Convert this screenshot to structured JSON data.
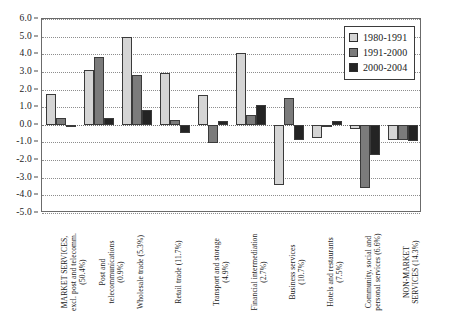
{
  "chart_data": {
    "type": "bar",
    "title": "",
    "subtitle": "",
    "xlabel": "",
    "ylabel": "",
    "ylim": [
      -5.0,
      6.0
    ],
    "ytick_step": 1.0,
    "yticks": [
      "6.0",
      "5.0",
      "4.0",
      "3.0",
      "2.0",
      "1.0",
      "0.0",
      "-1.0",
      "-2.0",
      "-3.0",
      "-4.0",
      "-5.0"
    ],
    "ytick_values": [
      6.0,
      5.0,
      4.0,
      3.0,
      2.0,
      1.0,
      0.0,
      -1.0,
      -2.0,
      -3.0,
      -4.0,
      -5.0
    ],
    "grid": true,
    "legend_position": "top-right",
    "categories": [
      "MARKET SERVICES,\nexcl. post and telecomm.\n(50.4%)",
      "Post and\ntelecommunications\n(0.9%)",
      "Wholesale trade (5.3%)",
      "Retail trade (11.7%)",
      "Transport and storage\n(4.9%)",
      "Financial intermediation\n(2.7%)",
      "Business services\n(10.7%)",
      "Hotels and restaurants\n(7.5%)",
      "Community, social and\npersonal services (6.6%)",
      "NON-MARKET\nSERVICES (14.3%)"
    ],
    "series": [
      {
        "name": "1980-1991",
        "color": "#d5d5d5",
        "values": [
          1.75,
          3.1,
          5.0,
          2.95,
          1.7,
          4.1,
          -3.4,
          -0.75,
          -0.25,
          -0.85
        ]
      },
      {
        "name": "1991-2000",
        "color": "#7b7b7b",
        "values": [
          0.4,
          3.85,
          2.85,
          0.3,
          -1.05,
          0.55,
          1.5,
          -0.1,
          -3.6,
          -0.85
        ]
      },
      {
        "name": "2000-2004",
        "color": "#242424",
        "values": [
          -0.15,
          0.4,
          0.85,
          -0.45,
          0.2,
          1.15,
          -0.85,
          0.2,
          -1.7,
          -0.9
        ]
      }
    ]
  },
  "legend": {
    "items": [
      {
        "label": "1980-1991",
        "swatch": "s0"
      },
      {
        "label": "1991-2000",
        "swatch": "s1"
      },
      {
        "label": "2000-2004",
        "swatch": "s2"
      }
    ]
  }
}
